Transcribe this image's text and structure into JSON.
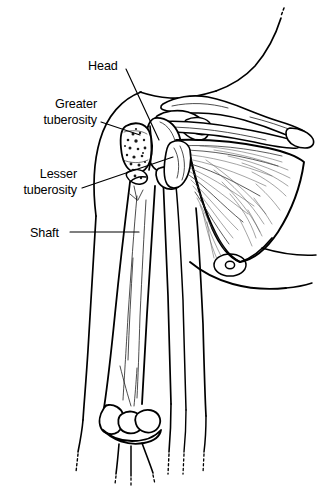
{
  "figure": {
    "style": "black and white line drawing with stipple and hatch shading",
    "background_color": "#ffffff",
    "line_color": "#000000",
    "width": 318,
    "height": 486
  },
  "labels": [
    {
      "id": "head",
      "text": "Head",
      "text_x": 88,
      "text_y": 66,
      "anchor": "start",
      "target_x": 159,
      "target_y": 140,
      "leader": "M126,69 L159,140"
    },
    {
      "id": "greater-tuberosity",
      "line1": "Greater",
      "line2": "tuberosity",
      "text_x": 97,
      "text_y": 106,
      "anchor": "end",
      "target_x": 140,
      "target_y": 135,
      "leader": "M101,122 L140,135"
    },
    {
      "id": "lesser-tuberosity",
      "line1": "Lesser",
      "line2": "tuberosity",
      "text_x": 77,
      "text_y": 178,
      "anchor": "end",
      "target_x": 173,
      "target_y": 157,
      "leader": "M82,188 L173,157"
    },
    {
      "id": "shaft",
      "text": "Shaft",
      "text_x": 30,
      "text_y": 236,
      "anchor": "start",
      "target_x": 139,
      "target_y": 232,
      "leader": "M70,232 L139,232"
    }
  ],
  "structures": [
    {
      "name": "humeral-head",
      "label": "Head"
    },
    {
      "name": "greater-tuberosity",
      "label": "Greater tuberosity"
    },
    {
      "name": "lesser-tuberosity",
      "label": "Lesser tuberosity"
    },
    {
      "name": "humeral-shaft",
      "label": "Shaft"
    },
    {
      "name": "clavicle",
      "label": "Clavicle"
    },
    {
      "name": "acromion",
      "label": "Acromion"
    },
    {
      "name": "scapula",
      "label": "Scapula"
    },
    {
      "name": "infraspinatus-muscle",
      "label": "Shoulder muscle striations"
    },
    {
      "name": "distal-humerus-condyles",
      "label": "Elbow condyles"
    },
    {
      "name": "torso-outline",
      "label": "Torso and arm skin outline"
    },
    {
      "name": "nipple-marking",
      "label": "Nipple"
    }
  ]
}
